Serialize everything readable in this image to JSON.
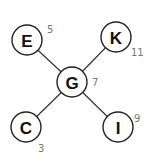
{
  "diagram": {
    "type": "tree",
    "nodes": [
      {
        "id": "G",
        "label": "G",
        "value": "7",
        "x": 72,
        "y": 82,
        "ax": 95,
        "ay": 86
      },
      {
        "id": "E",
        "label": "E",
        "value": "5",
        "x": 27,
        "y": 40,
        "ax": 47,
        "ay": 33
      },
      {
        "id": "K",
        "label": "K",
        "value": "11",
        "x": 116,
        "y": 37,
        "ax": 131,
        "ay": 56
      },
      {
        "id": "C",
        "label": "C",
        "value": "3",
        "x": 26,
        "y": 127,
        "ax": 38,
        "ay": 152
      },
      {
        "id": "I",
        "label": "I",
        "value": "9",
        "x": 118,
        "y": 127,
        "ax": 134,
        "ay": 122
      }
    ],
    "edges": [
      {
        "from": "G",
        "to": "E"
      },
      {
        "from": "G",
        "to": "K"
      },
      {
        "from": "G",
        "to": "C"
      },
      {
        "from": "G",
        "to": "I"
      }
    ]
  }
}
